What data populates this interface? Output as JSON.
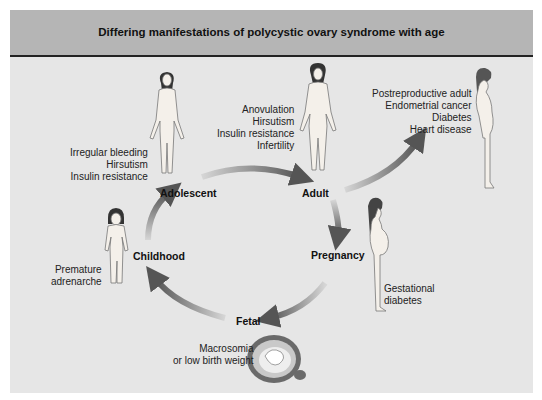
{
  "title": "Differing manifestations of polycystic ovary syndrome with age",
  "colors": {
    "panel_bg": "#e6e6e6",
    "header_bg": "#b5b5b5",
    "arrow_dark": "#555555",
    "arrow_light": "#d6d6d6"
  },
  "stages": {
    "adolescent": "Adolescent",
    "adult": "Adult",
    "pregnancy": "Pregnancy",
    "fetal": "Fetal",
    "childhood": "Childhood"
  },
  "manifestations": {
    "adolescent": [
      "Irregular bleeding",
      "Hirsutism",
      "Insulin resistance"
    ],
    "adult": [
      "Anovulation",
      "Hirsutism",
      "Insulin resistance",
      "Infertility"
    ],
    "postreproductive": [
      "Postreproductive adult",
      "Endometrial cancer",
      "Diabetes",
      "Heart disease"
    ],
    "pregnancy": [
      "Gestational",
      "diabetes"
    ],
    "fetal": [
      "Macrosomia",
      "or low birth weight"
    ],
    "childhood": [
      "Premature",
      "adrenarche"
    ]
  },
  "figures": [
    "adolescent-figure",
    "adult-figure",
    "postreproductive-figure",
    "pregnant-figure",
    "fetus-figure",
    "child-figure"
  ]
}
